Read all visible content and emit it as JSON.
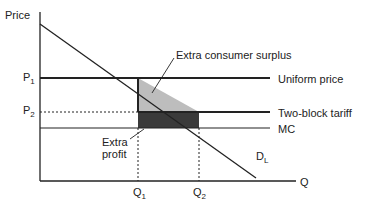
{
  "diagram": {
    "axes": {
      "y_label": "Price",
      "x_label": "Q"
    },
    "price_levels": [
      {
        "label": "P",
        "sub": "1",
        "line_label": "Uniform price"
      },
      {
        "label": "P",
        "sub": "2",
        "line_label": "Two-block tariff"
      }
    ],
    "mc_label": "MC",
    "demand_label": {
      "main": "D",
      "sub": "L"
    },
    "quantities": [
      {
        "label": "Q",
        "sub": "1"
      },
      {
        "label": "Q",
        "sub": "2"
      }
    ],
    "annotations": {
      "consumer_surplus": "Extra consumer surplus",
      "profit_line1": "Extra",
      "profit_line2": "profit"
    },
    "colors": {
      "line": "#222222",
      "consumer_surplus_fill": "#bdbdbd",
      "profit_fill": "#3a3a3a"
    }
  }
}
